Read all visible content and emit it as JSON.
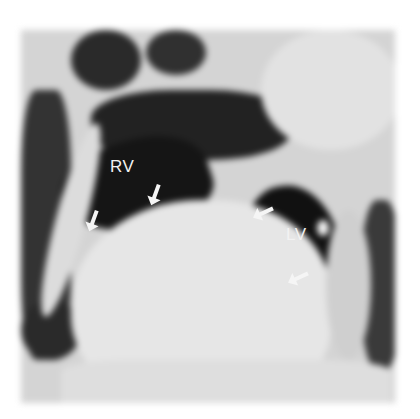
{
  "image": {
    "description": "Grayscale cardiac MRI image with labeled ventricles and pointing arrows",
    "labels": [
      {
        "text": "RV",
        "x": 110,
        "y": 157
      },
      {
        "text": "LV",
        "x": 286,
        "y": 225
      }
    ],
    "arrows": [
      {
        "x": 78,
        "y": 210,
        "rot": 110
      },
      {
        "x": 142,
        "y": 183,
        "rot": 110
      },
      {
        "x": 250,
        "y": 202,
        "rot": 155
      },
      {
        "x": 285,
        "y": 265,
        "rot": 155
      }
    ],
    "colors": {
      "background": "#ffffff",
      "tissue_light": "#e0e0e0",
      "tissue_mid": "#9a9a9a",
      "cavity_dark": "#1a1a1a",
      "label": "#f2f2f2"
    }
  }
}
